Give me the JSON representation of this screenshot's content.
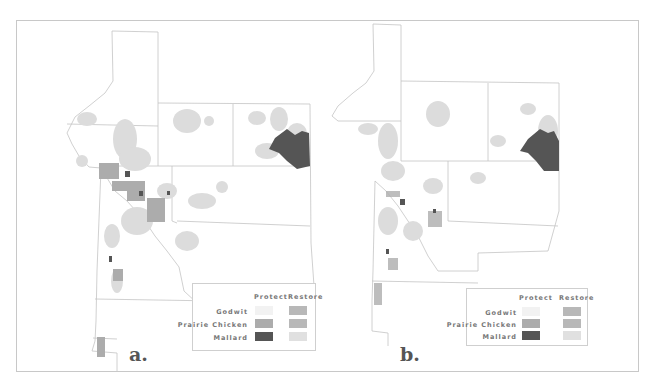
{
  "figure": {
    "panels": [
      {
        "label": "a.",
        "legend": {
          "columns": [
            "Protect",
            "Restore"
          ],
          "rows": [
            {
              "name": "Godwit",
              "protect_color": "#f2f2f2",
              "restore_color": "#b8b8b8"
            },
            {
              "name": "Prairie Chicken",
              "protect_color": "#acacac",
              "restore_color": "#b8b8b8"
            },
            {
              "name": "Mallard",
              "protect_color": "#555555",
              "restore_color": "#e0e0e0"
            }
          ]
        }
      },
      {
        "label": "b.",
        "legend": {
          "columns": [
            "Protect",
            "Restore"
          ],
          "rows": [
            {
              "name": "Godwit",
              "protect_color": "#f2f2f2",
              "restore_color": "#b8b8b8"
            },
            {
              "name": "Prairie Chicken",
              "protect_color": "#acacac",
              "restore_color": "#b8b8b8"
            },
            {
              "name": "Mallard",
              "protect_color": "#555555",
              "restore_color": "#e0e0e0"
            }
          ]
        }
      }
    ],
    "colors": {
      "boundary": "#c4c4c4",
      "restore_light": "#dcdcdc",
      "prairie_chicken": "#acacac",
      "mallard": "#555555"
    }
  }
}
